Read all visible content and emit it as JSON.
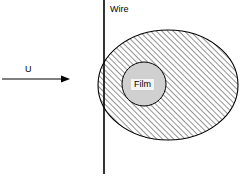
{
  "figure": {
    "background_color": "#ffffff",
    "line_color": "#000000",
    "hatch_color": "#3a3a3a",
    "film_fill_color": "#d0d0d0",
    "labels": {
      "wire": "Wire",
      "velocity": "U",
      "film": "Film"
    },
    "geometry": {
      "wire_x": 104,
      "wire_y_top": 0,
      "wire_y_bottom": 174,
      "ellipse_cx": 168,
      "ellipse_cy": 85,
      "ellipse_rx": 70,
      "ellipse_ry": 55,
      "film_cx": 144,
      "film_cy": 84,
      "film_r": 22,
      "arrow_x_start": 2,
      "arrow_x_end": 70,
      "arrow_y": 79
    }
  }
}
